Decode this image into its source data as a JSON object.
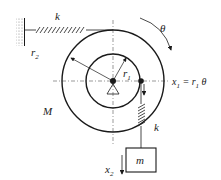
{
  "diagram": {
    "labels": {
      "spring_top": "k",
      "theta": "θ",
      "r2": "r",
      "r2_sub": "2",
      "r1": "r",
      "r1_sub": "1",
      "x1_eq_x": "x",
      "x1_eq_sub": "1",
      "x1_eq_rest": " = r",
      "x1_eq_sub2": "1",
      "x1_eq_theta": " θ",
      "mass_disk": "M",
      "spring_right": "k",
      "mass_block": "m",
      "x2": "x",
      "x2_sub": "2"
    },
    "colors": {
      "stroke": "#1a1a1a",
      "background": "#ffffff"
    }
  }
}
